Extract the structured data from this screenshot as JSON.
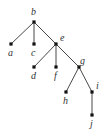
{
  "diagram": {
    "type": "rooted-tree",
    "nodes": [
      {
        "id": "b",
        "label": "b",
        "x": 34,
        "y": 22,
        "lx": 31,
        "ly": 15
      },
      {
        "id": "a",
        "label": "a",
        "x": 11,
        "y": 44,
        "lx": 8,
        "ly": 56
      },
      {
        "id": "c",
        "label": "c",
        "x": 34,
        "y": 44,
        "lx": 31,
        "ly": 56
      },
      {
        "id": "e",
        "label": "e",
        "x": 56,
        "y": 44,
        "lx": 60,
        "ly": 41
      },
      {
        "id": "d",
        "label": "d",
        "x": 34,
        "y": 67,
        "lx": 31,
        "ly": 79
      },
      {
        "id": "f",
        "label": "f",
        "x": 56,
        "y": 67,
        "lx": 54,
        "ly": 79
      },
      {
        "id": "g",
        "label": "g",
        "x": 79,
        "y": 67,
        "lx": 80,
        "ly": 64
      },
      {
        "id": "h",
        "label": "h",
        "x": 66,
        "y": 92,
        "lx": 63,
        "ly": 104
      },
      {
        "id": "i",
        "label": "i",
        "x": 92,
        "y": 92,
        "lx": 96,
        "ly": 89
      },
      {
        "id": "j",
        "label": "j",
        "x": 92,
        "y": 115,
        "lx": 90,
        "ly": 127
      }
    ],
    "edges": [
      [
        "b",
        "a"
      ],
      [
        "b",
        "c"
      ],
      [
        "b",
        "e"
      ],
      [
        "e",
        "d"
      ],
      [
        "e",
        "f"
      ],
      [
        "e",
        "g"
      ],
      [
        "g",
        "h"
      ],
      [
        "g",
        "i"
      ],
      [
        "i",
        "j"
      ]
    ]
  }
}
